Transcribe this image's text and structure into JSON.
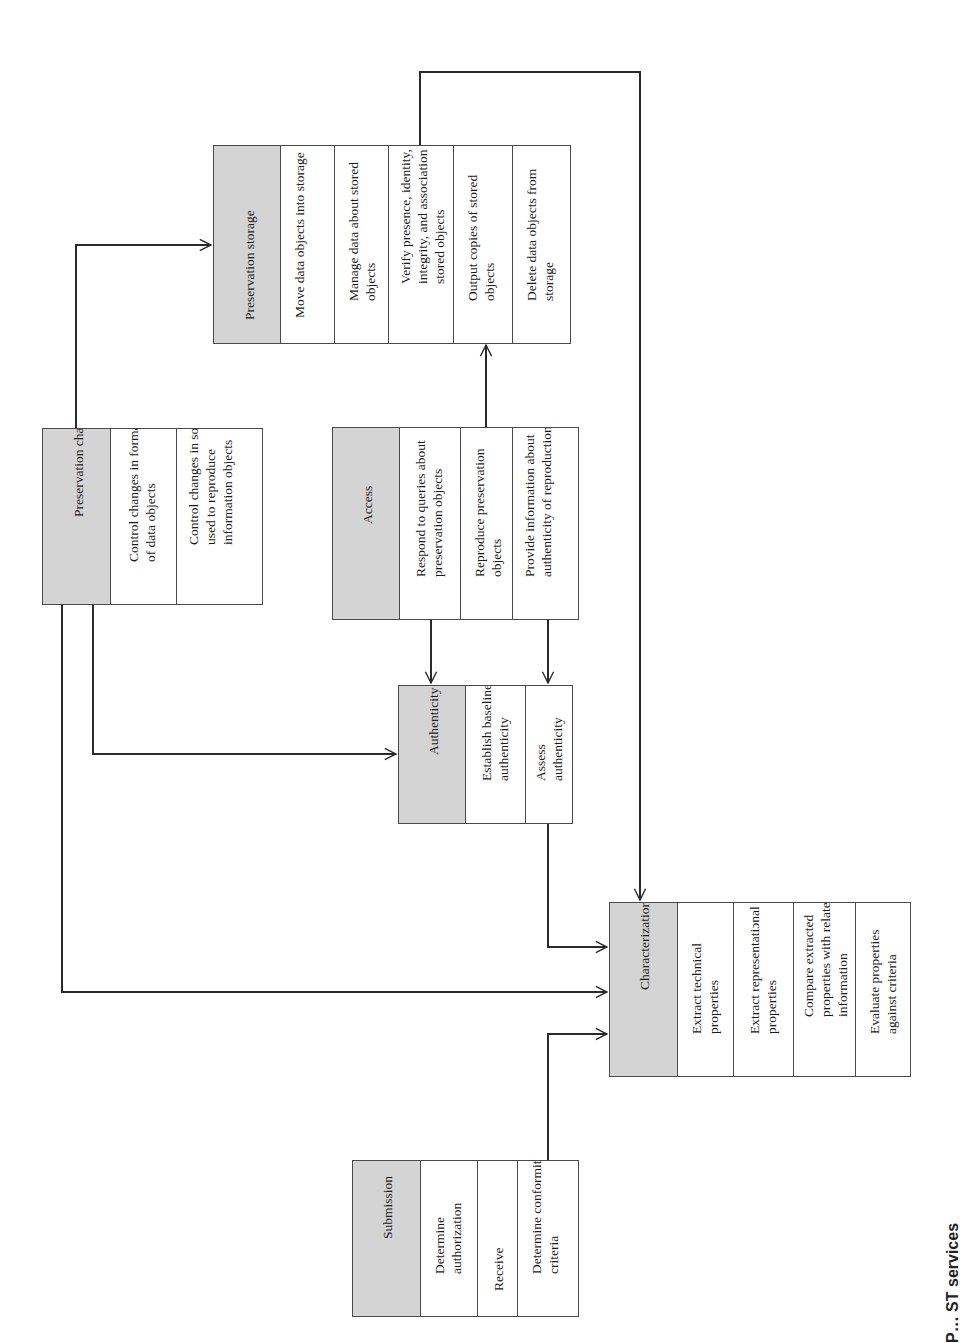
{
  "diagram": {
    "orientation": "rotated -90 degrees (page is landscape printed in portrait)",
    "nodes": {
      "preservation_storage": {
        "title": "Preservation storage",
        "items": [
          "Move data objects into storage",
          "Manage data about stored objects",
          "Verify presence, identity, integrity, and association of stored objects",
          "Output copies of stored objects",
          "Delete data objects from storage"
        ]
      },
      "preservation_change": {
        "title": "Preservation change",
        "items": [
          "Control changes in formats of data objects",
          "Control changes in software used to reproduce information objects"
        ]
      },
      "access": {
        "title": "Access",
        "items": [
          "Respond to queries about preservation objects",
          "Reproduce preservation objects",
          "Provide information about authenticity of reproductions"
        ]
      },
      "authenticity": {
        "title": "Authenticity",
        "items": [
          "Establish baseline authenticity",
          "Assess authenticity"
        ]
      },
      "characterization": {
        "title": "Characterizatior",
        "items": [
          "Extract technical properties",
          "Extract representatiɔnal properties",
          "Compare extracted properties with related information",
          "Evaluate properties against criteria"
        ]
      },
      "submission": {
        "title": "Submission",
        "items": [
          "Determine authorization",
          "Receive",
          "Determine conformity to criteria"
        ]
      }
    },
    "edges": [
      {
        "from": "Preservation change",
        "to": "Preservation storage"
      },
      {
        "from": "Preservation change",
        "to": "Authenticity"
      },
      {
        "from": "Preservation change",
        "to": "Characterization"
      },
      {
        "from": "Access: Reproduce preservation objects",
        "to": "Preservation storage: Output copies of stored objects"
      },
      {
        "from": "Access: Respond to queries about preservation objects",
        "to": "Authenticity"
      },
      {
        "from": "Access: Provide information about authenticity of reproductions",
        "to": "Authenticity: Assess authenticity"
      },
      {
        "from": "Authenticity: Assess authenticity",
        "to": "Characterization"
      },
      {
        "from": "Preservation storage: Verify presence, identity, integrity, and association of stored objects",
        "to": "Characterization"
      },
      {
        "from": "Submission: Determine conformity to criteria",
        "to": "Characterization"
      }
    ],
    "caption_fragment": "P…  ST services"
  },
  "colors": {
    "header_fill": "#d4d4d4",
    "line": "#2a2a2a",
    "border": "#4a4a4a",
    "background": "#ffffff"
  }
}
